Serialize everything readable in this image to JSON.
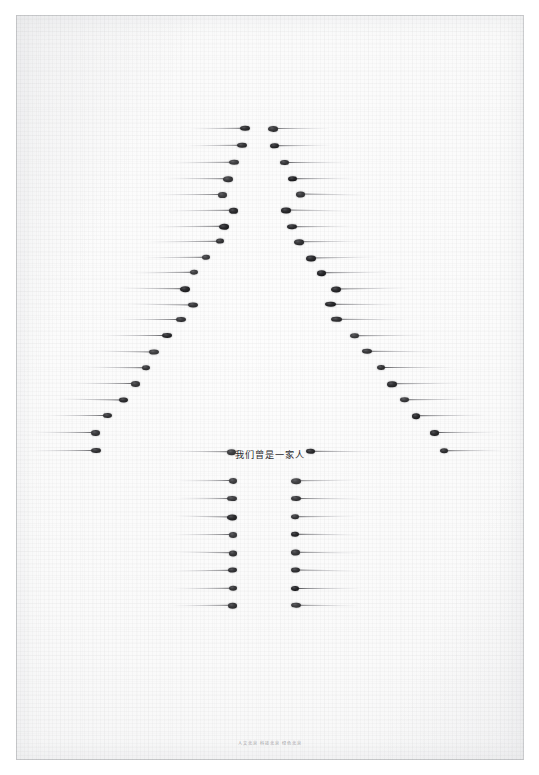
{
  "poster": {
    "medium": "matchstick-arrangement-photograph",
    "subject": "tree-silhouette-formed-from-matchsticks",
    "headline": "我们曾是一家人",
    "credit": "人文北京 科技北京 绿色北京",
    "colors": {
      "paper": "#fbfbfb",
      "surround": "#ffffff",
      "frame_line": "#c4c5c8",
      "match_head": "#1a1a1c",
      "match_shaft": "#8d8d93",
      "headline_text": "#2c2c30",
      "credit_text": "#9d9da2"
    }
  },
  "artwork": {
    "canopy_rows": [
      {
        "y": 128,
        "lx": 250,
        "ll": 62,
        "rx": 268,
        "rl": 62
      },
      {
        "y": 145,
        "lx": 247,
        "ll": 64,
        "rx": 270,
        "rl": 63
      },
      {
        "y": 162,
        "lx": 239,
        "ll": 70,
        "rx": 280,
        "rl": 68
      },
      {
        "y": 178,
        "lx": 233,
        "ll": 70,
        "rx": 288,
        "rl": 67
      },
      {
        "y": 194,
        "lx": 227,
        "ll": 73,
        "rx": 296,
        "rl": 70
      },
      {
        "y": 210,
        "lx": 238,
        "ll": 72,
        "rx": 281,
        "rl": 70
      },
      {
        "y": 226,
        "lx": 229,
        "ll": 76,
        "rx": 287,
        "rl": 66
      },
      {
        "y": 241,
        "lx": 224,
        "ll": 80,
        "rx": 294,
        "rl": 72
      },
      {
        "y": 257,
        "lx": 210,
        "ll": 70,
        "rx": 306,
        "rl": 72
      },
      {
        "y": 272,
        "lx": 198,
        "ll": 70,
        "rx": 317,
        "rl": 72
      },
      {
        "y": 288,
        "lx": 190,
        "ll": 74,
        "rx": 331,
        "rl": 78
      },
      {
        "y": 304,
        "lx": 198,
        "ll": 72,
        "rx": 325,
        "rl": 74
      },
      {
        "y": 319,
        "lx": 186,
        "ll": 72,
        "rx": 331,
        "rl": 76
      },
      {
        "y": 335,
        "lx": 172,
        "ll": 72,
        "rx": 350,
        "rl": 76
      },
      {
        "y": 351,
        "lx": 159,
        "ll": 70,
        "rx": 362,
        "rl": 74
      },
      {
        "y": 367,
        "lx": 150,
        "ll": 68,
        "rx": 377,
        "rl": 77
      },
      {
        "y": 383,
        "lx": 140,
        "ll": 70,
        "rx": 387,
        "rl": 74
      },
      {
        "y": 399,
        "lx": 128,
        "ll": 72,
        "rx": 400,
        "rl": 74
      },
      {
        "y": 415,
        "lx": 112,
        "ll": 66,
        "rx": 412,
        "rl": 74
      },
      {
        "y": 432,
        "lx": 100,
        "ll": 70,
        "rx": 430,
        "rl": 68
      },
      {
        "y": 450,
        "lx": 101,
        "ll": 72,
        "rx": 440,
        "rl": 64
      }
    ],
    "baseline_rows": [
      {
        "y": 451,
        "lx": 236,
        "ll": 72,
        "rx": 306,
        "rl": 72
      }
    ],
    "trunk_rows": [
      {
        "y": 480,
        "lx": 237,
        "ll": 62,
        "rx": 291,
        "rl": 68
      },
      {
        "y": 498,
        "lx": 237,
        "ll": 62,
        "rx": 291,
        "rl": 70
      },
      {
        "y": 516,
        "lx": 237,
        "ll": 64,
        "rx": 291,
        "rl": 66
      },
      {
        "y": 534,
        "lx": 237,
        "ll": 66,
        "rx": 291,
        "rl": 68
      },
      {
        "y": 552,
        "lx": 237,
        "ll": 64,
        "rx": 291,
        "rl": 70
      },
      {
        "y": 570,
        "lx": 237,
        "ll": 68,
        "rx": 291,
        "rl": 68
      },
      {
        "y": 588,
        "lx": 237,
        "ll": 66,
        "rx": 291,
        "rl": 70
      },
      {
        "y": 605,
        "lx": 237,
        "ll": 68,
        "rx": 291,
        "rl": 68
      }
    ],
    "headline_y": 447,
    "credit_y": 740
  }
}
